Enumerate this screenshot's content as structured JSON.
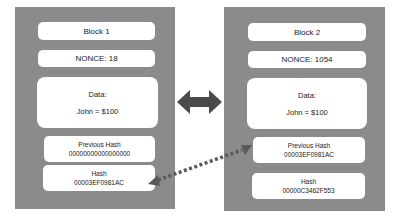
{
  "blocks": [
    {
      "title": "Block 1",
      "nonce": "NONCE: 18",
      "data_label": "Data:",
      "data_value": "John = $100",
      "previous_hash_label": "Previous Hash",
      "previous_hash": "00000000000000000",
      "hash_label": "Hash",
      "hash": "00003EF0981AC"
    },
    {
      "title": "Block 2",
      "nonce": "NONCE: 1054",
      "data_label": "Data:",
      "data_value": "John = $100",
      "previous_hash_label": "Previous Hash",
      "previous_hash": "00003EF0981AC",
      "hash_label": "Hash",
      "hash": "00000C3462F553"
    }
  ],
  "colors": {
    "panel": "#8b8b8b",
    "box": "#ffffff",
    "arrow": "#4a4a4a",
    "dotted_link": "#5a5a5a"
  },
  "connectors": {
    "block_link": "double-arrow",
    "hash_link": "dotted-arrow"
  }
}
